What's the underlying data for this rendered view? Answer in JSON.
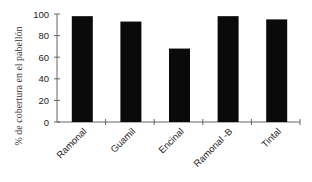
{
  "chart_data": {
    "type": "bar",
    "title": "",
    "xlabel": "",
    "ylabel": "% de cobertura en el pabellón",
    "categories": [
      "Ramonal",
      "Guamil",
      "Encinal",
      "Ramonal -B",
      "Tintal"
    ],
    "values": [
      98,
      93,
      68,
      98,
      95
    ],
    "ylim": [
      0,
      100
    ],
    "yticks": [
      0,
      20,
      40,
      60,
      80,
      100
    ],
    "grid": false,
    "legend": null,
    "bar_color": "#0a0a0a"
  }
}
